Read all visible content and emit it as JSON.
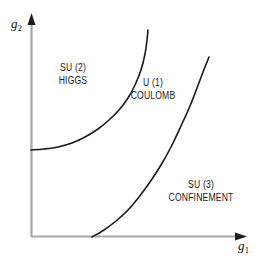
{
  "figure": {
    "background_color": "#ffffff",
    "width": 263,
    "height": 262
  },
  "axes": {
    "x_axis": {
      "name": "g1",
      "label_main": "g",
      "label_sub": "1",
      "color": "#a8a8a8",
      "arrowhead_color": "#1a1a1a",
      "origin_px": [
        31,
        237
      ],
      "end_px": [
        246,
        237
      ]
    },
    "y_axis": {
      "name": "g2",
      "label_main": "g",
      "label_sub": "2",
      "color": "#a8a8a8",
      "arrowhead_color": "#1a1a1a",
      "origin_px": [
        31,
        237
      ],
      "end_px": [
        31,
        14
      ]
    }
  },
  "regions": [
    {
      "id": "su2-higgs",
      "line1": "SU (2)",
      "line2": "HIGGS"
    },
    {
      "id": "u1-coulomb",
      "line1": "U (1)",
      "line2": "COULOMB"
    },
    {
      "id": "su3-confinement",
      "line1": "SU (3)",
      "line2": "CONFINEMENT"
    }
  ],
  "chart_data": {
    "type": "line",
    "title": "",
    "xlabel": "g_1",
    "ylabel": "g_2",
    "grid": false,
    "legend": "none",
    "xlim": [
      0,
      1
    ],
    "ylim": [
      0,
      1
    ],
    "annotations": [
      {
        "text": "SU (2) HIGGS",
        "x_px": 73,
        "y_px": 74
      },
      {
        "text": "U (1) COULOMB",
        "x_px": 153,
        "y_px": 89
      },
      {
        "text": "SU (3) CONFINEMENT",
        "x_px": 201,
        "y_px": 191
      }
    ],
    "series": [
      {
        "name": "higgs-coulomb-boundary",
        "color": "#1a1a1a",
        "linewidth": 1.6,
        "points_px": [
          [
            31,
            150
          ],
          [
            44,
            149
          ],
          [
            58,
            147
          ],
          [
            72,
            143
          ],
          [
            85,
            137
          ],
          [
            98,
            129
          ],
          [
            109,
            120
          ],
          [
            119,
            110
          ],
          [
            128,
            98
          ],
          [
            135,
            85
          ],
          [
            141,
            70
          ],
          [
            145,
            54
          ],
          [
            147,
            40
          ],
          [
            148,
            30
          ]
        ]
      },
      {
        "name": "coulomb-confinement-boundary",
        "color": "#1a1a1a",
        "linewidth": 1.6,
        "points_px": [
          [
            92,
            237
          ],
          [
            104,
            230
          ],
          [
            116,
            221
          ],
          [
            128,
            210
          ],
          [
            139,
            197
          ],
          [
            150,
            182
          ],
          [
            161,
            165
          ],
          [
            171,
            147
          ],
          [
            181,
            126
          ],
          [
            190,
            106
          ],
          [
            197,
            88
          ],
          [
            203,
            72
          ],
          [
            207,
            62
          ],
          [
            209,
            57
          ]
        ]
      }
    ]
  }
}
